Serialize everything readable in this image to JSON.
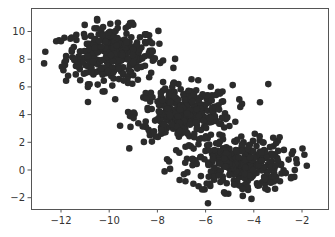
{
  "chart_data": {
    "type": "scatter",
    "title": "",
    "xlabel": "",
    "ylabel": "",
    "xlim": [
      -13.25,
      1.1
    ],
    "ylim": [
      -2.85,
      11.45
    ],
    "grid": false,
    "legend": null,
    "xticks": [
      -12,
      -10,
      -8,
      -6,
      -4,
      -2
    ],
    "yticks": [
      -2,
      0,
      2,
      4,
      6,
      8,
      10
    ],
    "xtick_labels": [
      "−12",
      "−10",
      "−8",
      "−6",
      "−4",
      "−2"
    ],
    "ytick_labels": [
      "−2",
      "0",
      "2",
      "4",
      "6",
      "8",
      "10"
    ],
    "marker_color": "#2b2b2b",
    "marker_size": 3.3,
    "series": [
      {
        "name": "cluster-1",
        "center": [
          -9.9,
          8.3
        ],
        "std": [
          0.95,
          1.0
        ],
        "n": 330
      },
      {
        "name": "cluster-2",
        "center": [
          -6.9,
          4.1
        ],
        "std": [
          1.0,
          1.0
        ],
        "n": 330
      },
      {
        "name": "cluster-3",
        "center": [
          -4.6,
          0.4
        ],
        "std": [
          1.0,
          0.95
        ],
        "n": 330
      }
    ],
    "outliers": [
      [
        -12.7,
        7.7
      ],
      [
        -12.2,
        9.3
      ],
      [
        -12.0,
        9.3
      ],
      [
        -10.5,
        10.9
      ],
      [
        -9.2,
        10.4
      ],
      [
        -11.9,
        7.2
      ],
      [
        -3.4,
        6.2
      ],
      [
        -5.1,
        3.8
      ],
      [
        -1.9,
        1.1
      ],
      [
        -1.8,
        0.3
      ],
      [
        -2.3,
        0.0
      ],
      [
        -5.9,
        -2.4
      ],
      [
        -6.9,
        -0.3
      ],
      [
        -4.6,
        5.1
      ],
      [
        -7.7,
        -0.1
      ]
    ]
  },
  "frame": {
    "left": 31,
    "top": 8,
    "right": 328,
    "bottom": 209,
    "x_px_per_unit": 24.1,
    "x_origin_px": 350.2,
    "y_px_per_unit": 13.85,
    "y_origin_px": 170
  }
}
